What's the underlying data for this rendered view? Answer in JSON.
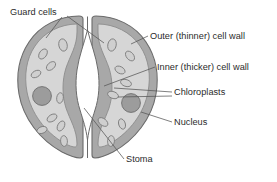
{
  "diagram": {
    "colors": {
      "background": "#ffffff",
      "cell_wall": "#a8a8a8",
      "cell_wall_outline": "#6e6e6e",
      "cytoplasm": "#d3d3d3",
      "cytoplasm_outline": "#8a8a8a",
      "chloroplast_fill": "#cfcfcf",
      "chloroplast_outline": "#777777",
      "nucleus_fill": "#9a9a9a",
      "nucleus_outline": "#6a6a6a",
      "stoma_fill": "#ffffff",
      "leader_line": "#555555",
      "text": "#2b2b2b"
    },
    "labels": [
      {
        "id": "guard-cells",
        "text": "Guard cells",
        "x": 10,
        "y": 15,
        "anchor": "start"
      },
      {
        "id": "outer-cell-wall",
        "text": "Outer (thinner) cell wall",
        "x": 150,
        "y": 39,
        "anchor": "start"
      },
      {
        "id": "inner-cell-wall",
        "text": "Inner (thicker) cell wall",
        "x": 157,
        "y": 70,
        "anchor": "start"
      },
      {
        "id": "chloroplasts",
        "text": "Chloroplasts",
        "x": 174,
        "y": 95,
        "anchor": "start"
      },
      {
        "id": "nucleus",
        "text": "Nucleus",
        "x": 174,
        "y": 125,
        "anchor": "start"
      },
      {
        "id": "stoma",
        "text": "Stoma",
        "x": 126,
        "y": 162,
        "anchor": "start"
      }
    ],
    "leader_lines": [
      {
        "id": "guard-cells-left",
        "points": "62,17 46,38"
      },
      {
        "id": "guard-cells-right",
        "points": "67,16 104,43"
      },
      {
        "id": "outer-wall-line",
        "points": "148,36 131,44"
      },
      {
        "id": "inner-wall-line",
        "points": "155,67 104,86"
      },
      {
        "id": "chloroplast-upper",
        "points": "172,92 114,88"
      },
      {
        "id": "chloroplast-lower",
        "points": "172,96 118,96"
      },
      {
        "id": "nucleus-line",
        "points": "172,122 142,113"
      },
      {
        "id": "stoma-line",
        "points": "124,159 84,108"
      }
    ],
    "structures": {
      "guard_cell_left": "kidney-shaped left guard cell",
      "guard_cell_right": "kidney-shaped right guard cell",
      "stoma_pore": "central lens-shaped stomatal pore",
      "chloroplast_count_left": 8,
      "chloroplast_count_right": 8,
      "nucleus_count": 2
    }
  }
}
